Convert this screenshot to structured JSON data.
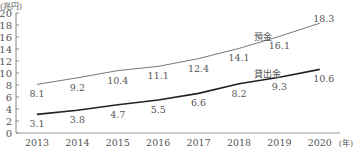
{
  "chart_data": {
    "type": "line",
    "title": "",
    "ylabel": "(兆円)",
    "xlabel": "(年)",
    "ylim": [
      0,
      20
    ],
    "yticks": [
      0,
      2,
      4,
      6,
      8,
      10,
      12,
      14,
      16,
      18,
      20
    ],
    "categories": [
      "2013",
      "2014",
      "2015",
      "2016",
      "2017",
      "2018",
      "2019",
      "2020"
    ],
    "series": [
      {
        "name": "預金",
        "values": [
          8.1,
          9.2,
          10.4,
          11.1,
          12.4,
          14.1,
          16.1,
          18.3
        ],
        "color": "#777777"
      },
      {
        "name": "貸出金",
        "values": [
          3.1,
          3.8,
          4.7,
          5.5,
          6.6,
          8.2,
          9.3,
          10.6
        ],
        "color": "#222222"
      }
    ],
    "grid": false,
    "legend": "inline labels"
  }
}
